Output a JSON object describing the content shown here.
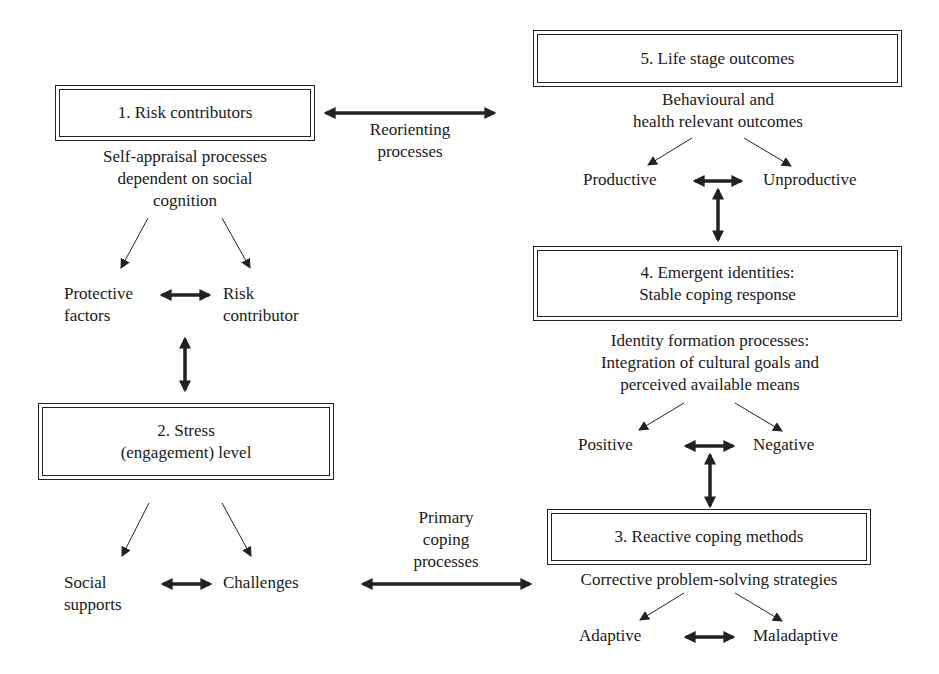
{
  "boxes": {
    "risk": {
      "line1": "1. Risk contributors"
    },
    "stress": {
      "line1": "2. Stress",
      "line2": "(engagement) level"
    },
    "reactive": {
      "line1": "3. Reactive coping methods"
    },
    "emergent": {
      "line1": "4. Emergent identities:",
      "line2": "Stable coping response"
    },
    "life": {
      "line1": "5. Life stage outcomes"
    }
  },
  "processes": {
    "risk": [
      "Self-appraisal processes",
      "dependent on social",
      "cognition"
    ],
    "life": [
      "Behavioural and",
      "health relevant outcomes"
    ],
    "emergent": [
      "Identity formation processes:",
      "Integration of cultural goals and",
      "perceived available means"
    ],
    "reactive": [
      "Corrective problem-solving strategies"
    ]
  },
  "outcomes": {
    "risk": {
      "left": [
        "Protective",
        "factors"
      ],
      "right": [
        "Risk",
        "contributor"
      ]
    },
    "stress": {
      "left": [
        "Social",
        "supports"
      ],
      "right": [
        "Challenges"
      ]
    },
    "life": {
      "left": "Productive",
      "right": "Unproductive"
    },
    "emergent": {
      "left": "Positive",
      "right": "Negative"
    },
    "reactive": {
      "left": "Adaptive",
      "right": "Maladaptive"
    }
  },
  "links": {
    "reorienting": [
      "Reorienting",
      "processes"
    ],
    "primary": [
      "Primary",
      "coping",
      "processes"
    ]
  },
  "colors": {
    "line": "#222222",
    "background": "#ffffff"
  }
}
